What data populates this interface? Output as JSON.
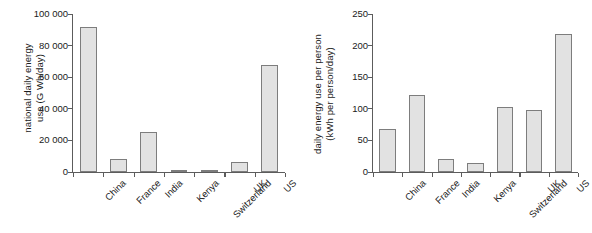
{
  "figure": {
    "panels": [
      {
        "id": "national-daily-energy-use",
        "ylabel_line1": "national daily energy",
        "ylabel_line2": "use (G Wh/day)"
      },
      {
        "id": "daily-energy-use-per-person",
        "ylabel_line1": "daily energy use per person",
        "ylabel_line2": "(kWh per person/day)"
      }
    ]
  },
  "chart_data": [
    {
      "type": "bar",
      "title": "",
      "xlabel": "",
      "ylabel": "national daily energy use (G Wh/day)",
      "categories": [
        "China",
        "France",
        "India",
        "Kenya",
        "Switzerland",
        "UK",
        "US"
      ],
      "values": [
        92000,
        8200,
        25500,
        800,
        1100,
        6500,
        68000
      ],
      "ylim": [
        0,
        100000
      ],
      "yticks": [
        0,
        20000,
        40000,
        60000,
        80000,
        100000
      ],
      "ytick_labels": [
        "0",
        "20 000",
        "40 000",
        "60 000",
        "80 000",
        "100 000"
      ],
      "grid": false,
      "legend": "none",
      "bar_fill": "#e2e2e2",
      "bar_edge": "#7d7d7d"
    },
    {
      "type": "bar",
      "title": "",
      "xlabel": "",
      "ylabel": "daily energy use per person (kWh per person/day)",
      "categories": [
        "China",
        "France",
        "India",
        "Kenya",
        "Switzerland",
        "UK",
        "US"
      ],
      "values": [
        68,
        122,
        20,
        15,
        103,
        98,
        218
      ],
      "ylim": [
        0,
        250
      ],
      "yticks": [
        0,
        50,
        100,
        150,
        200,
        250
      ],
      "ytick_labels": [
        "0",
        "50",
        "100",
        "150",
        "200",
        "250"
      ],
      "grid": false,
      "legend": "none",
      "bar_fill": "#e2e2e2",
      "bar_edge": "#7d7d7d"
    }
  ]
}
